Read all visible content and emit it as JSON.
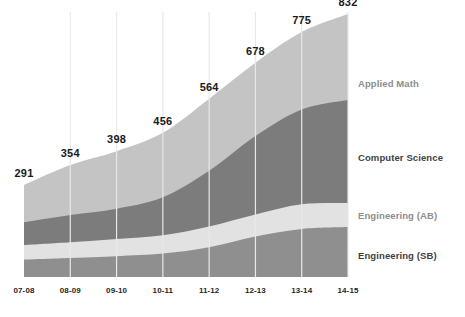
{
  "chart_data": {
    "type": "area",
    "stacked": true,
    "title": "",
    "subtitle": "",
    "xlabel": "",
    "ylabel": "",
    "grid": "vertical-only",
    "legend_position": "right-inline",
    "ylim": [
      0,
      832
    ],
    "categories": [
      "07-08",
      "08-09",
      "09-10",
      "10-11",
      "11-12",
      "12-13",
      "13-14",
      "14-15"
    ],
    "totals": [
      291,
      354,
      398,
      456,
      564,
      678,
      775,
      832
    ],
    "total_labels": [
      "291",
      "354",
      "398",
      "456",
      "564",
      "678",
      "775",
      "832"
    ],
    "series": [
      {
        "name": "Engineering (SB)",
        "color": "#8f8f8f",
        "values": [
          55,
          60,
          66,
          74,
          94,
          128,
          152,
          158
        ]
      },
      {
        "name": "Engineering (AB)",
        "color": "#e2e2e2",
        "values": [
          46,
          50,
          54,
          58,
          66,
          70,
          78,
          76
        ]
      },
      {
        "name": "Computer Science",
        "color": "#7c7c7c",
        "values": [
          72,
          86,
          96,
          120,
          176,
          248,
          300,
          326
        ]
      },
      {
        "name": "Applied Math",
        "color": "#c4c4c4",
        "values": [
          118,
          158,
          182,
          204,
          228,
          232,
          245,
          272
        ]
      }
    ]
  },
  "series_labels": {
    "applied_math": "Applied Math",
    "computer_science": "Computer Science",
    "engineering_ab": "Engineering (AB)",
    "engineering_sb": "Engineering (SB)"
  },
  "colors": {
    "applied_math": "#c4c4c4",
    "computer_science": "#7c7c7c",
    "engineering_ab": "#e2e2e2",
    "engineering_sb": "#8f8f8f",
    "gridline": "#e8e8e8",
    "data_label": "#1a1a1a",
    "tick_label": "#1f1f1f",
    "legend_dark": "#3f3f3f",
    "legend_mid": "#8d8d8d",
    "background": "#ffffff"
  }
}
